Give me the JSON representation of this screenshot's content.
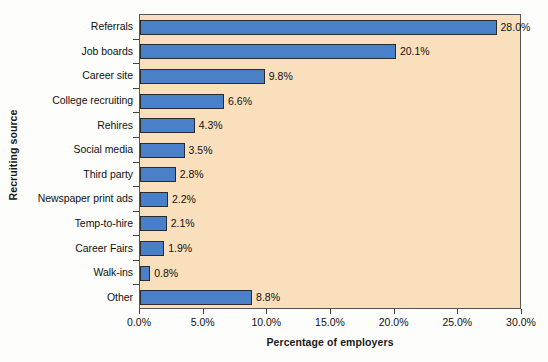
{
  "chart_data": {
    "type": "bar",
    "orientation": "horizontal",
    "title": "",
    "xlabel": "Percentage of employers",
    "ylabel": "Recruiting source",
    "categories": [
      "Referrals",
      "Job boards",
      "Career site",
      "College recruiting",
      "Rehires",
      "Social media",
      "Third party",
      "Newspaper print ads",
      "Temp-to-hire",
      "Career Fairs",
      "Walk-ins",
      "Other"
    ],
    "values": [
      28.0,
      20.1,
      9.8,
      6.6,
      4.3,
      3.5,
      2.8,
      2.2,
      2.1,
      1.9,
      0.8,
      8.8
    ],
    "value_labels": [
      "28.0%",
      "20.1%",
      "9.8%",
      "6.6%",
      "4.3%",
      "3.5%",
      "2.8%",
      "2.2%",
      "2.1%",
      "1.9%",
      "0.8%",
      "8.8%"
    ],
    "xlim": [
      0.0,
      30.0
    ],
    "xticks": [
      0.0,
      5.0,
      10.0,
      15.0,
      20.0,
      25.0,
      30.0
    ],
    "xtick_labels": [
      "0.0%",
      "5.0%",
      "10.0%",
      "15.0%",
      "20.0%",
      "25.0%",
      "30.0%"
    ],
    "grid": false,
    "legend": null,
    "colors": {
      "bar_fill": "#4a80c8",
      "bar_border": "#2b2b2b",
      "plot_background": "#f9dfbb",
      "plot_border": "#555555",
      "figure_background": "#fdfdfb",
      "text": "#111111"
    }
  }
}
